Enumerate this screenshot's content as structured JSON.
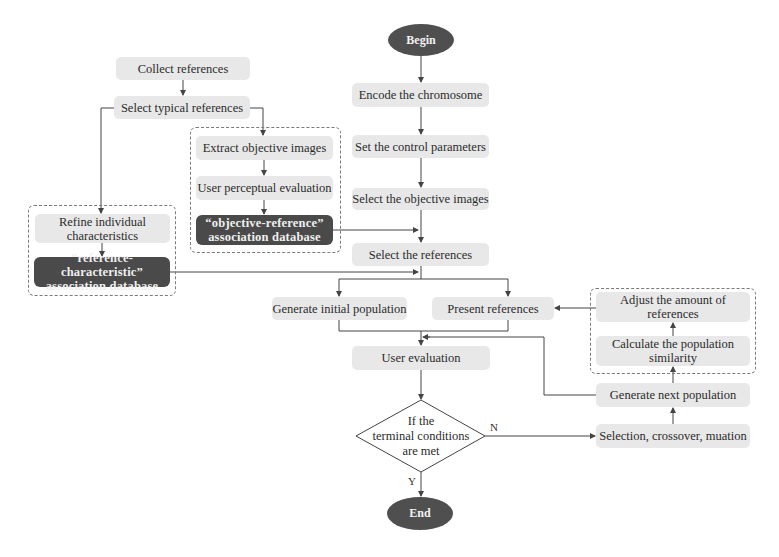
{
  "diagram": {
    "type": "flowchart",
    "terminals": {
      "begin": "Begin",
      "end": "End"
    },
    "main_flow": {
      "encode": "Encode the chromosome",
      "set_params": "Set the control parameters",
      "select_objective": "Select the objective images",
      "select_refs": "Select the references",
      "generate_initial": "Generate initial population",
      "present_refs": "Present references",
      "user_eval": "User evaluation",
      "decision": {
        "line1": "If the",
        "line2": "terminal conditions",
        "line3": "are met",
        "yes_label": "Y",
        "no_label": "N"
      }
    },
    "reference_prep": {
      "collect": "Collect references",
      "select_typical": "Select typical references"
    },
    "objective_group": {
      "extract": "Extract objective images",
      "perceptual": "User perceptual evaluation",
      "db_line1": "“objective-reference”",
      "db_line2": "association database"
    },
    "characteristic_group": {
      "refine_line1": "Refine individual",
      "refine_line2": "characteristics",
      "db_line1": "“reference-characteristic”",
      "db_line2": "association database"
    },
    "evolution_loop": {
      "selection": "Selection, crossover, muation",
      "generate_next": "Generate next population",
      "calc_line1": "Calculate the population",
      "calc_line2": "similarity",
      "adjust_line1": "Adjust the amount of",
      "adjust_line2": "references"
    },
    "colors": {
      "box_fill": "#e8e8e8",
      "dark_fill": "#4a4a4a",
      "terminal_fill": "#4f4f4f",
      "line": "#444444",
      "dashed_border": "#7a7a7a"
    }
  }
}
